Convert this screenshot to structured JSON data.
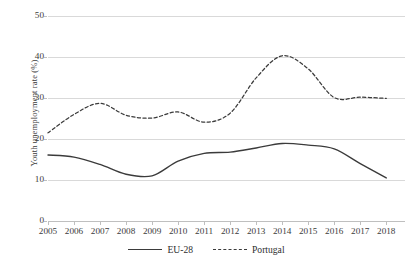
{
  "chart_data": {
    "type": "line",
    "title": "",
    "xlabel": "",
    "ylabel": "Youth unemployment rate (%)",
    "categories": [
      "2005",
      "2006",
      "2007",
      "2008",
      "2009",
      "2010",
      "2011",
      "2012",
      "2013",
      "2014",
      "2015",
      "2016",
      "2017",
      "2018"
    ],
    "x": [
      2005,
      2006,
      2007,
      2008,
      2009,
      2010,
      2011,
      2012,
      2013,
      2014,
      2015,
      2016,
      2017,
      2018
    ],
    "xlim": [
      2005,
      2018
    ],
    "ylim": [
      0,
      50
    ],
    "y_ticks": [
      0,
      10,
      20,
      30,
      40,
      50
    ],
    "grid": true,
    "legend_position": "bottom",
    "series": [
      {
        "name": "EU-28",
        "style": "solid",
        "color": "#3b3b3b",
        "values": [
          16.1,
          15.6,
          13.8,
          11.4,
          11.0,
          14.6,
          16.5,
          16.8,
          17.8,
          18.9,
          18.5,
          17.6,
          14.0,
          10.5
        ]
      },
      {
        "name": "Portugal",
        "style": "dashed",
        "color": "#3b3b3b",
        "values": [
          21.5,
          26.0,
          28.7,
          25.8,
          25.1,
          26.6,
          24.1,
          26.3,
          34.9,
          40.3,
          37.1,
          30.1,
          30.2,
          29.9
        ]
      }
    ],
    "legend": [
      {
        "label": "EU-28",
        "style": "solid"
      },
      {
        "label": "Portugal",
        "style": "dashed"
      }
    ]
  }
}
